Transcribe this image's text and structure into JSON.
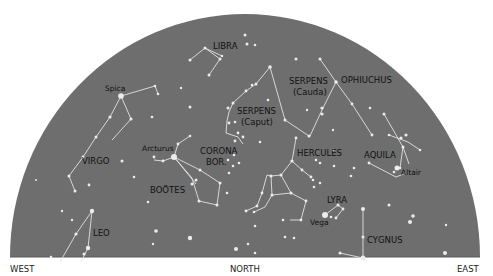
{
  "diagram": {
    "type": "star-chart",
    "colors": {
      "sky": "#6e6e6e",
      "star": "#ececec",
      "line": "#e2e2e2",
      "label": "#111111"
    },
    "directions": {
      "west": "WEST",
      "north": "NORTH",
      "east": "EAST"
    },
    "constellations": [
      {
        "id": "libra",
        "label": "LIBRA"
      },
      {
        "id": "virgo",
        "label": "VIRGO"
      },
      {
        "id": "bootes",
        "label": "BOÖTES"
      },
      {
        "id": "corona",
        "label": "CORONA",
        "label2": "BOR."
      },
      {
        "id": "serpens-caput",
        "label": "SERPENS",
        "label2": "(Caput)"
      },
      {
        "id": "serpens-cauda",
        "label": "SERPENS",
        "label2": "(Cauda)"
      },
      {
        "id": "ophiuchus",
        "label": "OPHIUCHUS"
      },
      {
        "id": "hercules",
        "label": "HERCULES"
      },
      {
        "id": "aquila",
        "label": "AQUILA"
      },
      {
        "id": "lyra",
        "label": "LYRA"
      },
      {
        "id": "cygnus",
        "label": "CYGNUS"
      },
      {
        "id": "leo",
        "label": "LEO"
      }
    ],
    "stars": {
      "spica": "Spica",
      "arcturus": "Arcturus",
      "vega": "Vega",
      "altair": "Altair"
    }
  }
}
